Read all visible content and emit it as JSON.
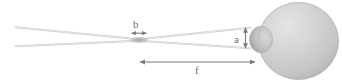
{
  "figure": {
    "name": "laser-beam-focusing-into-eye-diagram",
    "width": 342,
    "height": 83,
    "background_color": "#ffffff"
  },
  "labels": {
    "beam_waist_diameter": "b",
    "spot_height_at_cornea": "a",
    "focal_distance": "f"
  },
  "colors": {
    "beam": "#cfcfcf",
    "beam_waist": "#b4b4b4",
    "eyeball_fill": "#cdcdcd",
    "eyeball_highlight": "#e2e2e2",
    "eyeball_shadow": "#b0b0b0",
    "cornea_fill": "#c6c6c6",
    "cornea_shadow": "#9e9e9e",
    "arrow": "#7a7a7a",
    "label_text": "#6e6e6e"
  },
  "elements": {
    "beam_upper_ray_label": "upper-beam-ray",
    "beam_lower_ray_label": "lower-beam-ray",
    "beam_waist_label": "beam-waist-ellipse",
    "eyeball_label": "eyeball-sphere",
    "cornea_label": "cornea-bump",
    "arrow_b_label": "dimension-arrow-b",
    "arrow_a_label": "dimension-arrow-a",
    "arrow_f_label": "dimension-arrow-f"
  }
}
